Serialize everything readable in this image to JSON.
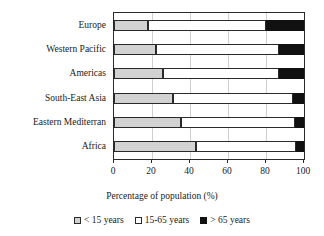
{
  "chart_data": {
    "type": "bar",
    "orientation": "horizontal",
    "stacked": true,
    "title": "",
    "xlabel": "Percentage of population (%)",
    "ylabel": "",
    "xlim": [
      0,
      100
    ],
    "xticks": [
      0,
      20,
      40,
      60,
      80,
      100
    ],
    "xticklabels": [
      "0",
      "20",
      "40",
      "60",
      "80",
      "100"
    ],
    "grid": true,
    "grid_axis": "x",
    "legend_position": "bottom",
    "categories": [
      "Europe",
      "Western Pacific",
      "Americas",
      "South-East Asia",
      "Eastern Mediterran",
      "Africa"
    ],
    "series": [
      {
        "name": "< 15 years",
        "color": "#d2d2d2",
        "values": [
          18,
          22,
          26,
          31,
          35,
          43
        ]
      },
      {
        "name": "15-65 years",
        "color": "#ffffff",
        "values": [
          62,
          65,
          61,
          63,
          60,
          53
        ]
      },
      {
        "name": "> 65 years",
        "color": "#111111",
        "values": [
          20,
          13,
          13,
          6,
          5,
          4
        ]
      }
    ]
  },
  "legend": {
    "items": [
      {
        "label": "< 15 years",
        "swatch": "legend-swatch-under-15"
      },
      {
        "label": "15-65 years",
        "swatch": "legend-swatch-15-65"
      },
      {
        "label": "> 65 years",
        "swatch": "legend-swatch-over-65"
      }
    ]
  },
  "axis": {
    "x_title": "Percentage of population (%)"
  }
}
